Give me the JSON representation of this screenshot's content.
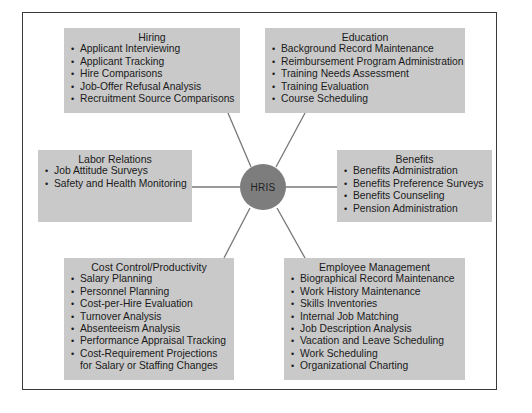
{
  "diagram": {
    "hub": {
      "label": "HRIS"
    },
    "boxes": {
      "hiring": {
        "title": "Hiring",
        "items": [
          "Applicant Interviewing",
          "Applicant Tracking",
          "Hire Comparisons",
          "Job-Offer Refusal Analysis",
          "Recruitment Source Comparisons"
        ]
      },
      "education": {
        "title": "Education",
        "items": [
          "Background Record Maintenance",
          "Reimbursement Program Administration",
          "Training Needs Assessment",
          "Training Evaluation",
          "Course Scheduling"
        ]
      },
      "labor_relations": {
        "title": "Labor Relations",
        "items": [
          "Job Attitude Surveys",
          "Safety and Health Monitoring"
        ]
      },
      "benefits": {
        "title": "Benefits",
        "items": [
          "Benefits Administration",
          "Benefits Preference Surveys",
          "Benefits Counseling",
          "Pension Administration"
        ]
      },
      "cost_control": {
        "title": "Cost Control/Productivity",
        "items": [
          "Salary Planning",
          "Personnel Planning",
          "Cost-per-Hire Evaluation",
          "Turnover Analysis",
          "Absenteeism Analysis",
          "Performance Appraisal Tracking",
          "Cost-Requirement Projections for Salary or Staffing Changes"
        ]
      },
      "employee_management": {
        "title": "Employee Management",
        "items": [
          "Biographical Record Maintenance",
          "Work History Maintenance",
          "Skills Inventories",
          "Internal Job Matching",
          "Job Description Analysis",
          "Vacation and Leave Scheduling",
          "Work Scheduling",
          "Organizational Charting"
        ]
      }
    },
    "colors": {
      "box_fill": "#c9c9c9",
      "hub_fill": "#7d7d7d",
      "line": "#777777",
      "frame": "#3a3a3a"
    }
  }
}
